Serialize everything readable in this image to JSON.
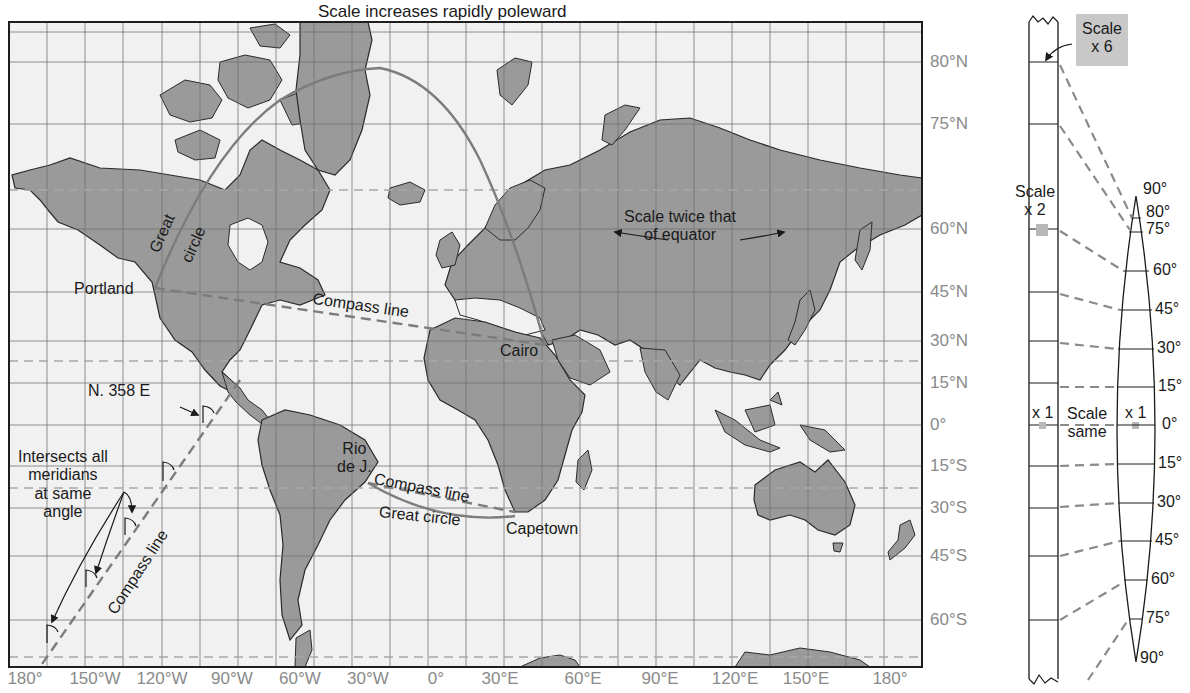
{
  "figure": {
    "title": "Scale increases rapidly poleward",
    "colors": {
      "ocean": "#f1f1f1",
      "land": "#9a9a9a",
      "coast": "#2a2a2a",
      "grid": "#6e6e6e",
      "dashed_parallel": "#a8a8a8",
      "route": "#7c7c7c",
      "axis_label": "#8a8a8a",
      "annotation": "#1a1a1a",
      "scale_box": "#c8c8c8"
    }
  },
  "map": {
    "projection": "Mercator",
    "latitude_labels": [
      {
        "label": "80°N",
        "y": 62
      },
      {
        "label": "75°N",
        "y": 124
      },
      {
        "label": "60°N",
        "y": 229
      },
      {
        "label": "45°N",
        "y": 292
      },
      {
        "label": "30°N",
        "y": 341
      },
      {
        "label": "15°N",
        "y": 383
      },
      {
        "label": "0°",
        "y": 425
      },
      {
        "label": "15°S",
        "y": 466
      },
      {
        "label": "30°S",
        "y": 508
      },
      {
        "label": "45°S",
        "y": 556
      },
      {
        "label": "60°S",
        "y": 620
      }
    ],
    "longitude_labels": [
      {
        "label": "180°",
        "x": 25
      },
      {
        "label": "150°W",
        "x": 95
      },
      {
        "label": "120°W",
        "x": 162
      },
      {
        "label": "90°W",
        "x": 232
      },
      {
        "label": "60°W",
        "x": 300
      },
      {
        "label": "30°W",
        "x": 368
      },
      {
        "label": "0°",
        "x": 436
      },
      {
        "label": "30°E",
        "x": 500
      },
      {
        "label": "60°E",
        "x": 583
      },
      {
        "label": "90°E",
        "x": 660
      },
      {
        "label": "120°E",
        "x": 735
      },
      {
        "label": "150°E",
        "x": 806
      },
      {
        "label": "180°",
        "x": 890
      }
    ],
    "places": {
      "portland": "Portland",
      "cairo": "Cairo",
      "rio_line1": "Rio",
      "rio_line2": "de J.",
      "capetown": "Capetown"
    },
    "annotations": {
      "great_circle_1": "Great",
      "great_circle_2": "circle",
      "compass_line_north": "Compass line",
      "compass_line_south": "Compass line",
      "great_circle_south": "Great circle",
      "scale_twice_1": "Scale twice that",
      "scale_twice_2": "of equator",
      "bearing": "N. 358 E",
      "intersects_1": "Intersects all",
      "intersects_2": "meridians",
      "intersects_3": "at same",
      "intersects_4": "angle",
      "compass_line_diagonal": "Compass line"
    },
    "routes": [
      {
        "name": "Portland to Cairo",
        "great_circle": "solid",
        "compass_line": "dashed"
      },
      {
        "name": "Rio de Janeiro to Capetown",
        "great_circle": "solid",
        "compass_line": "dashed"
      }
    ]
  },
  "scale_diagram": {
    "strip_labels": {
      "scale_x6_1": "Scale",
      "scale_x6_2": "x 6",
      "scale_x2_1": "Scale",
      "scale_x2_2": "x 2",
      "x1_left": "x 1",
      "x1_right": "x 1",
      "same_1": "Scale",
      "same_2": "same"
    },
    "gore_labels": [
      {
        "label": "90°",
        "y": 190
      },
      {
        "label": "80°",
        "y": 216
      },
      {
        "label": "75°",
        "y": 232
      },
      {
        "label": "60°",
        "y": 271
      },
      {
        "label": "45°",
        "y": 310
      },
      {
        "label": "30°",
        "y": 349
      },
      {
        "label": "15°",
        "y": 387
      },
      {
        "label": "0°",
        "y": 425
      },
      {
        "label": "15°",
        "y": 464
      },
      {
        "label": "30°",
        "y": 503
      },
      {
        "label": "45°",
        "y": 541
      },
      {
        "label": "60°",
        "y": 580
      },
      {
        "label": "75°",
        "y": 619
      },
      {
        "label": "90°",
        "y": 659
      }
    ]
  }
}
